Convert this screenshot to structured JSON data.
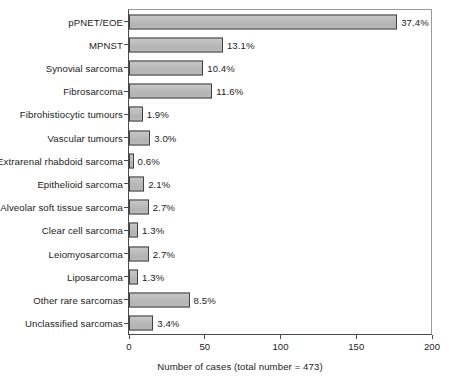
{
  "chart_data": {
    "type": "bar",
    "orientation": "horizontal",
    "title": "",
    "xlabel": "Number of cases (total number = 473)",
    "ylabel": "",
    "xlim": [
      0,
      200
    ],
    "xticks": [
      0,
      50,
      100,
      150,
      200
    ],
    "xtick_labels": [
      "0",
      "50",
      "100",
      "150",
      "200"
    ],
    "grid": false,
    "legend": null,
    "total_cases": 473,
    "categories": [
      "pPNET/EOE",
      "MPNST",
      "Synovial sarcoma",
      "Fibrosarcoma",
      "Fibrohistiocytic tumours",
      "Vascular tumours",
      "Extrarenal rhabdoid sarcoma",
      "Epithelioid sarcoma",
      "Alveolar soft tissue sarcoma",
      "Clear cell sarcoma",
      "Leiomyosarcoma",
      "Liposarcoma",
      "Other rare sarcomas",
      "Unclassified sarcomas"
    ],
    "values": [
      177,
      62,
      49,
      55,
      9,
      14,
      3,
      10,
      13,
      6,
      13,
      6,
      40,
      16
    ],
    "percent_labels": [
      "37.4%",
      "13.1%",
      "10.4%",
      "11.6%",
      "1.9%",
      "3.0%",
      "0.6%",
      "2.1%",
      "2.7%",
      "1.3%",
      "2.7%",
      "1.3%",
      "8.5%",
      "3.4%"
    ],
    "percents": [
      37.4,
      13.1,
      10.4,
      11.6,
      1.9,
      3.0,
      0.6,
      2.1,
      2.7,
      1.3,
      2.7,
      1.3,
      8.5,
      3.4
    ],
    "colors": {
      "bar_fill": "#bcbcbc",
      "bar_border": "#3f3f3f",
      "axis": "#4a4a4a",
      "frame": "#9a9a9a",
      "text": "#1c1c1c",
      "background": "#ffffff"
    }
  }
}
